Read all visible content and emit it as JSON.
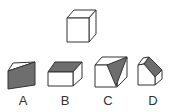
{
  "question": {
    "reference": "cube",
    "options": [
      {
        "label": "A",
        "description": "cube cut with gray slanted face"
      },
      {
        "label": "B",
        "description": "half cube with gray top face"
      },
      {
        "label": "C",
        "description": "cube with gray triangular face"
      },
      {
        "label": "D",
        "description": "cube with gray beveled edge"
      }
    ]
  },
  "colors": {
    "stroke": "#333333",
    "shade": "#6e6e6e",
    "face": "#ffffff"
  }
}
